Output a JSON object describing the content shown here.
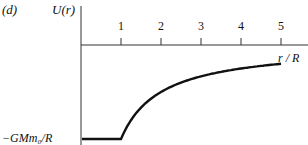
{
  "chart_data": {
    "type": "line",
    "panel_label": "(d)",
    "title": "",
    "ylabel": "U(r)",
    "xlabel": "r / R",
    "x_ticks": [
      "1",
      "2",
      "3",
      "4",
      "5"
    ],
    "y_annotation": "−GMm₀/R",
    "xlim": [
      0,
      5.2
    ],
    "ylim": [
      -1,
      0.3
    ],
    "grid": false,
    "legend": null,
    "series": [
      {
        "name": "U(r)",
        "description": "constant -GMm0/R for r<R, then -GMm0/r for r>R",
        "x": [
          0,
          0.5,
          1,
          1.25,
          1.5,
          2,
          2.5,
          3,
          3.5,
          4,
          4.5,
          5
        ],
        "y": [
          -1,
          -1,
          -1,
          -0.8,
          -0.667,
          -0.5,
          -0.4,
          -0.333,
          -0.286,
          -0.25,
          -0.222,
          -0.2
        ]
      }
    ]
  }
}
